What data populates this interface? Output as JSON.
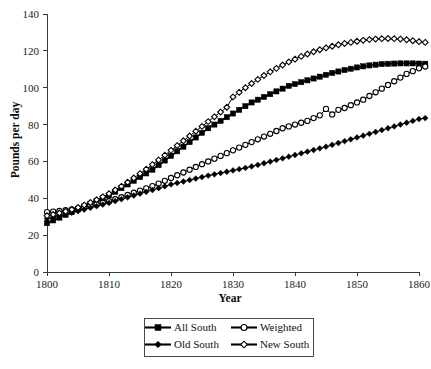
{
  "chart_data": {
    "type": "line",
    "title": "",
    "xlabel": "Year",
    "ylabel": "Pounds per day",
    "xlim": [
      1800,
      1860
    ],
    "ylim": [
      0,
      140
    ],
    "grid": false,
    "legend_position": "bottom-center",
    "xticks": [
      1800,
      1810,
      1820,
      1830,
      1840,
      1850,
      1860
    ],
    "yticks": [
      0,
      20,
      40,
      60,
      80,
      100,
      120,
      140
    ],
    "x": [
      1800,
      1801,
      1802,
      1803,
      1804,
      1805,
      1806,
      1807,
      1808,
      1809,
      1810,
      1811,
      1812,
      1813,
      1814,
      1815,
      1816,
      1817,
      1818,
      1819,
      1820,
      1821,
      1822,
      1823,
      1824,
      1825,
      1826,
      1827,
      1828,
      1829,
      1830,
      1831,
      1832,
      1833,
      1834,
      1835,
      1836,
      1837,
      1838,
      1839,
      1840,
      1841,
      1842,
      1843,
      1844,
      1845,
      1846,
      1847,
      1848,
      1849,
      1850,
      1851,
      1852,
      1853,
      1854,
      1855,
      1856,
      1857,
      1858,
      1859,
      1860,
      1861
    ],
    "series": [
      {
        "name": "All South",
        "marker": "filled-square",
        "values": [
          26.5,
          28.0,
          29.5,
          31.0,
          32.5,
          34.0,
          35.5,
          37.0,
          38.5,
          40.0,
          41.5,
          43.5,
          45.5,
          47.5,
          49.5,
          51.5,
          53.5,
          55.5,
          58.0,
          60.5,
          63.0,
          65.5,
          68.0,
          70.5,
          73.0,
          75.5,
          78.0,
          80.0,
          82.0,
          84.0,
          86.0,
          88.0,
          90.0,
          92.0,
          93.5,
          95.0,
          96.5,
          98.0,
          99.5,
          101.0,
          102.0,
          103.0,
          104.0,
          105.0,
          106.0,
          107.0,
          108.0,
          108.8,
          109.6,
          110.3,
          111.0,
          111.6,
          112.1,
          112.5,
          112.8,
          113.0,
          113.1,
          113.2,
          113.2,
          113.2,
          113.1,
          113.0
        ]
      },
      {
        "name": "Weighted",
        "marker": "open-circle",
        "values": [
          32.5,
          32.8,
          33.1,
          33.5,
          34.0,
          34.5,
          35.2,
          36.0,
          36.8,
          37.6,
          38.4,
          39.5,
          40.6,
          41.8,
          43.0,
          44.2,
          45.4,
          46.6,
          48.0,
          49.5,
          51.0,
          52.5,
          54.0,
          55.5,
          57.0,
          58.5,
          60.0,
          61.5,
          63.0,
          64.5,
          66.0,
          67.5,
          69.0,
          70.5,
          72.0,
          73.5,
          75.0,
          76.5,
          78.0,
          79.0,
          80.0,
          81.0,
          82.0,
          83.5,
          85.0,
          88.5,
          85.5,
          88.0,
          89.0,
          90.5,
          92.0,
          93.5,
          95.5,
          97.5,
          99.5,
          101.5,
          103.5,
          105.5,
          107.5,
          109.0,
          110.5,
          111.5
        ]
      },
      {
        "name": "Old South",
        "marker": "filled-diamond",
        "values": [
          29.0,
          29.8,
          30.6,
          31.4,
          32.2,
          33.0,
          33.9,
          34.8,
          35.7,
          36.6,
          37.5,
          38.5,
          39.5,
          40.5,
          41.5,
          42.5,
          43.5,
          44.5,
          45.5,
          46.5,
          47.5,
          48.3,
          49.1,
          49.9,
          50.7,
          51.5,
          52.3,
          53.0,
          53.7,
          54.4,
          55.1,
          55.8,
          56.5,
          57.3,
          58.1,
          59.0,
          59.9,
          60.8,
          61.7,
          62.6,
          63.5,
          64.4,
          65.3,
          66.2,
          67.1,
          68.0,
          69.0,
          70.0,
          71.0,
          72.0,
          73.0,
          74.0,
          75.0,
          76.0,
          77.0,
          78.0,
          79.0,
          80.0,
          81.0,
          82.0,
          83.0,
          83.5
        ]
      },
      {
        "name": "New South",
        "marker": "open-diamond",
        "values": [
          30.5,
          31.2,
          32.0,
          32.9,
          33.9,
          35.0,
          36.3,
          37.7,
          39.2,
          40.8,
          42.5,
          44.5,
          46.5,
          48.7,
          51.0,
          53.4,
          55.8,
          58.3,
          60.8,
          63.4,
          66.0,
          68.6,
          71.2,
          73.8,
          76.4,
          79.0,
          81.6,
          84.2,
          86.8,
          89.4,
          95.0,
          97.5,
          100.0,
          102.3,
          104.5,
          106.6,
          108.6,
          110.5,
          112.3,
          114.0,
          115.5,
          117.0,
          118.3,
          119.5,
          120.6,
          121.6,
          122.5,
          123.3,
          124.0,
          124.6,
          125.2,
          125.7,
          126.1,
          126.4,
          126.6,
          126.7,
          126.6,
          126.4,
          126.0,
          125.5,
          125.0,
          124.6
        ]
      }
    ]
  },
  "legend": {
    "entries": [
      {
        "label": "All South",
        "marker": "filled-square"
      },
      {
        "label": "Weighted",
        "marker": "open-circle"
      },
      {
        "label": "Old South",
        "marker": "filled-diamond"
      },
      {
        "label": "New South",
        "marker": "open-diamond"
      }
    ]
  },
  "axes": {
    "y_title": "Pounds per day",
    "x_title": "Year",
    "y_tick_labels": [
      "140",
      "120",
      "100",
      "80",
      "60",
      "40",
      "20",
      "0"
    ],
    "x_tick_labels": [
      "1800",
      "1810",
      "1820",
      "1830",
      "1840",
      "1850",
      "1860"
    ]
  }
}
